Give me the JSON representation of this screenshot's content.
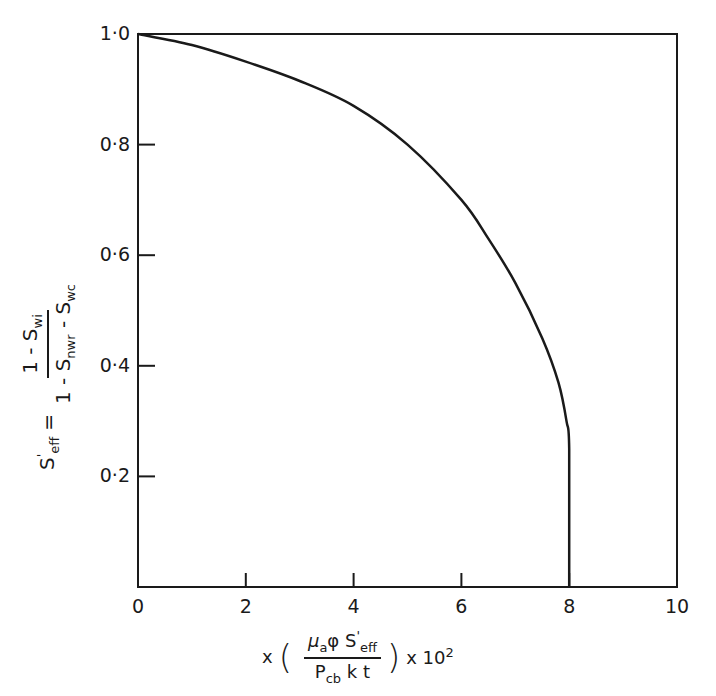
{
  "chart_data": {
    "type": "line",
    "title": "",
    "xlabel": "x ( μa φ S'eff / Pcb k t ) x 10^2",
    "ylabel": "S'eff = (1 - Swi) / (1 - Snwr - Swc)",
    "xlim": [
      0,
      10
    ],
    "ylim": [
      0,
      1.0
    ],
    "grid": false,
    "legend": null,
    "x_ticks": [
      "0",
      "2",
      "4",
      "6",
      "8",
      "10"
    ],
    "y_ticks": [
      "1.0",
      "0.8",
      "0.6",
      "0.4",
      "0.2"
    ],
    "series": [
      {
        "name": "S'eff",
        "x": [
          0,
          1,
          2,
          3,
          4,
          5,
          6,
          6.5,
          7,
          7.5,
          7.8,
          7.95,
          8.0,
          8.0
        ],
        "y": [
          1.0,
          0.98,
          0.95,
          0.915,
          0.87,
          0.8,
          0.7,
          0.63,
          0.55,
          0.45,
          0.37,
          0.3,
          0.25,
          0.0
        ]
      }
    ]
  },
  "axes": {
    "y_tick_labels": [
      "1.0",
      "0.8",
      "0.6",
      "0.4",
      "0.2"
    ],
    "x_tick_labels": [
      "0",
      "2",
      "4",
      "6",
      "8",
      "10"
    ],
    "ylabel": {
      "lhs": "S",
      "lhs_sup": "'",
      "lhs_sub": "eff",
      "eq": "=",
      "num_a": "1 - S",
      "num_sub": "wi",
      "den_a": "1 - S",
      "den_sub1": "nwr",
      "den_b": " - S",
      "den_sub2": "wc"
    },
    "xlabel": {
      "prefix": "x",
      "num_mu": "μ",
      "num_mu_sub": "a",
      "num_phi": "φ S",
      "num_sup": "'",
      "num_sub": "eff",
      "den_p": "P",
      "den_p_sub": "cb",
      "den_rest": " k t",
      "suffix": "x 10",
      "suffix_sup": "2"
    }
  }
}
